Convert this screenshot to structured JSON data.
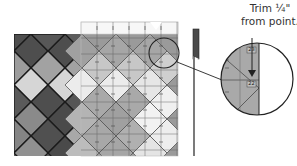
{
  "diagram": {
    "callout": {
      "line1": "Trim ¼\"",
      "line2": "from point."
    },
    "magnifier": {
      "ruler_label_top": "23",
      "ruler_label_mid": "22"
    },
    "colors": {
      "quilt_dark": "#555555",
      "quilt_mid": "#7a7a7a",
      "quilt_light": "#a8a8a8",
      "quilt_lightest": "#dcdcdc",
      "ruler_overlay": "#e8e8e8",
      "seam": "#1a1a1a",
      "marker": "#4a4a4a",
      "magnifier_fill": "#a9a9a9"
    },
    "quilt": {
      "columns": 7,
      "rows": 8,
      "left_panel_rows_shades": [
        [
          "dark",
          "dark",
          "dark",
          "dark"
        ],
        [
          "mid",
          "mid",
          "mid",
          "mid"
        ],
        [
          "light",
          "light",
          "light",
          "light"
        ],
        [
          "lightest",
          "lightest",
          "lightest",
          "lightest"
        ],
        [
          "dark",
          "dark",
          "dark",
          "dark"
        ],
        [
          "mid",
          "mid",
          "mid",
          "mid"
        ],
        [
          "mid",
          "dark",
          "dark",
          "dark"
        ],
        [
          "mid",
          "dark",
          "light",
          "dark"
        ]
      ]
    }
  }
}
